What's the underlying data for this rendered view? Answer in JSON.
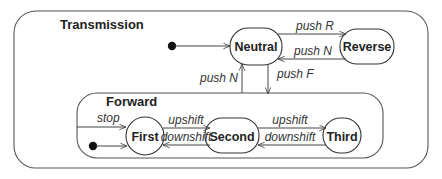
{
  "diagram": {
    "type": "state-machine",
    "outer_state": {
      "label": "Transmission"
    },
    "composite_state": {
      "label": "Forward"
    },
    "states": {
      "neutral": "Neutral",
      "reverse": "Reverse",
      "first": "First",
      "second": "Second",
      "third": "Third"
    },
    "transitions": {
      "neutral_to_reverse": "push R",
      "reverse_to_neutral": "push N",
      "forward_to_neutral": "push N",
      "neutral_to_forward": "push F",
      "stop_to_first": "stop",
      "first_to_second": "upshift",
      "second_to_first": "downshift",
      "second_to_third": "upshift",
      "third_to_second": "downshift"
    },
    "colors": {
      "stroke": "#444444",
      "text": "#222222",
      "background": "#ffffff"
    }
  }
}
